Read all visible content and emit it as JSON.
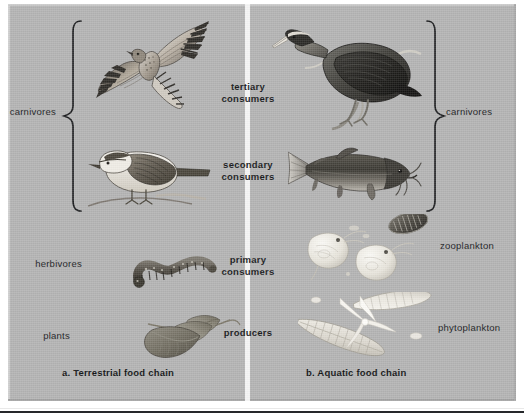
{
  "figure": {
    "background_color": "#b3b3b3",
    "divider_color": "#f4f4f4"
  },
  "panels": [
    {
      "id": "terrestrial",
      "caption": "a. Terrestrial food chain",
      "side_labels": [
        {
          "name": "carnivores-label-left",
          "text": "carnivores"
        },
        {
          "name": "herbivores-label",
          "text": "herbivores"
        },
        {
          "name": "plants-label",
          "text": "plants"
        }
      ],
      "organisms": [
        {
          "name": "hawk",
          "trophic": "tertiary consumers"
        },
        {
          "name": "songbird",
          "trophic": "secondary consumers"
        },
        {
          "name": "caterpillar",
          "trophic": "primary consumers"
        },
        {
          "name": "leaves",
          "trophic": "producers"
        }
      ]
    },
    {
      "id": "aquatic",
      "caption": "b. Aquatic food chain",
      "side_labels": [
        {
          "name": "carnivores-label-right",
          "text": "carnivores"
        },
        {
          "name": "zooplankton-label",
          "text": "zooplankton"
        },
        {
          "name": "phytoplankton-label",
          "text": "phytoplankton"
        }
      ],
      "organisms": [
        {
          "name": "heron",
          "trophic": "tertiary consumers"
        },
        {
          "name": "catfish",
          "trophic": "secondary consumers"
        },
        {
          "name": "zooplankton",
          "trophic": "primary consumers"
        },
        {
          "name": "phytoplankton",
          "trophic": "producers"
        }
      ]
    }
  ],
  "trophic_levels": [
    {
      "line1": "tertiary",
      "line2": "consumers"
    },
    {
      "line1": "secondary",
      "line2": "consumers"
    },
    {
      "line1": "primary",
      "line2": "consumers"
    },
    {
      "line1": "producers",
      "line2": ""
    }
  ]
}
